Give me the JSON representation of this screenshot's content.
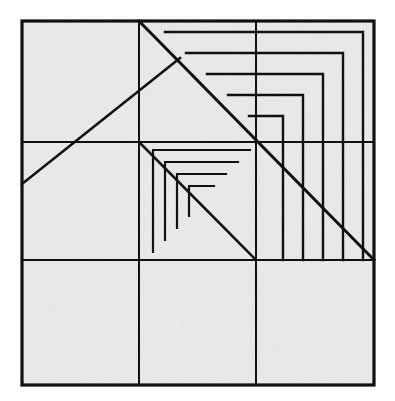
{
  "figure": {
    "type": "line-drawing",
    "canvas": {
      "width": 395,
      "height": 401
    },
    "colors": {
      "page_background": "#ffffff",
      "fill": "#eceaea",
      "stroke": "#111111",
      "texture_light": "#f4f3f2",
      "texture_dark": "#e2e0e0"
    },
    "outer_square": {
      "x": 22,
      "y": 21,
      "width": 352,
      "height": 364,
      "stroke_width": 3.2
    },
    "grid": {
      "rows": 3,
      "columns": 3,
      "stroke_width": 2.0,
      "vertical_lines_x": [
        139,
        256
      ],
      "horizontal_lines_y": [
        142,
        260
      ]
    },
    "main_diagonal": {
      "label": "top-center to bottom-right diagonal",
      "x1": 139,
      "y1": 21,
      "x2": 374,
      "y2": 260,
      "stroke_width": 3.0
    },
    "left_diagonal": {
      "label": "left edge to center diagonal",
      "x1": 22,
      "y1": 184,
      "x2": 180,
      "y2": 58,
      "stroke_width": 2.6
    },
    "center_diagonal": {
      "label": "center cell diagonal",
      "x1": 139,
      "y1": 142,
      "x2": 256,
      "y2": 260,
      "stroke_width": 2.6
    },
    "outer_spiral": {
      "label": "nested L shapes in upper-right quadrant",
      "corner_x": 374,
      "corner_y": 260,
      "stroke_width": 2.4,
      "arms": [
        {
          "top_y": 32,
          "right_x": 363
        },
        {
          "top_y": 53,
          "right_x": 343
        },
        {
          "top_y": 74,
          "right_x": 323
        },
        {
          "top_y": 95,
          "right_x": 303
        },
        {
          "top_y": 116,
          "right_x": 283
        }
      ],
      "left_start_x": 165,
      "bottom_end_y": 260
    },
    "inner_spiral": {
      "label": "nested L shapes in center cell",
      "corner_x": 256,
      "corner_y": 260,
      "stroke_width": 2.2,
      "arms": [
        {
          "top_y": 150,
          "left_x": 153
        },
        {
          "top_y": 162,
          "left_x": 165
        },
        {
          "top_y": 174,
          "left_x": 177
        },
        {
          "top_y": 186,
          "left_x": 189
        }
      ]
    },
    "regions": [
      {
        "name": "cell-top-left",
        "row": 1,
        "column": 1
      },
      {
        "name": "cell-top-center",
        "row": 1,
        "column": 2
      },
      {
        "name": "cell-top-right",
        "row": 1,
        "column": 3
      },
      {
        "name": "cell-middle-left",
        "row": 2,
        "column": 1
      },
      {
        "name": "cell-middle-center",
        "row": 2,
        "column": 2
      },
      {
        "name": "cell-middle-right",
        "row": 2,
        "column": 3
      },
      {
        "name": "cell-bottom-left",
        "row": 3,
        "column": 1
      },
      {
        "name": "cell-bottom-center",
        "row": 3,
        "column": 2
      },
      {
        "name": "cell-bottom-right",
        "row": 3,
        "column": 3
      }
    ]
  }
}
